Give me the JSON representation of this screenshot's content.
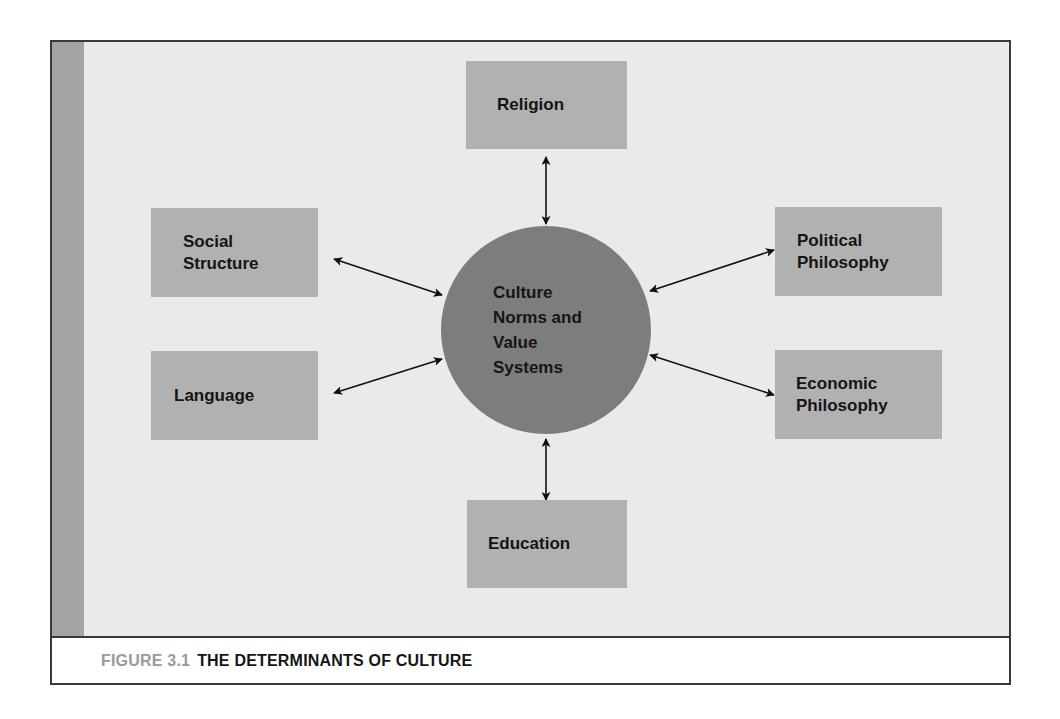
{
  "figure": {
    "number": "FIGURE 3.1",
    "title": "THE DETERMINANTS OF CULTURE"
  },
  "center": {
    "lines": [
      "Culture",
      "Norms and",
      "Value",
      "Systems"
    ]
  },
  "nodes": {
    "religion": {
      "lines": [
        "Religion"
      ]
    },
    "social_structure": {
      "lines": [
        "Social",
        "Structure"
      ]
    },
    "language": {
      "lines": [
        "Language"
      ]
    },
    "political_philosophy": {
      "lines": [
        "Political",
        "Philosophy"
      ]
    },
    "economic_philosophy": {
      "lines": [
        "Economic",
        "Philosophy"
      ]
    },
    "education": {
      "lines": [
        "Education"
      ]
    }
  },
  "edges": [
    {
      "from": "culture",
      "to": "religion",
      "type": "bidirectional"
    },
    {
      "from": "culture",
      "to": "social_structure",
      "type": "bidirectional"
    },
    {
      "from": "culture",
      "to": "language",
      "type": "bidirectional"
    },
    {
      "from": "culture",
      "to": "political_philosophy",
      "type": "bidirectional"
    },
    {
      "from": "culture",
      "to": "economic_philosophy",
      "type": "bidirectional"
    },
    {
      "from": "culture",
      "to": "education",
      "type": "bidirectional"
    }
  ],
  "colors": {
    "panel_bg": "#eaeaea",
    "left_strip": "#a4a4a4",
    "box_fill": "#b1b1b1",
    "circle_fill": "#7d7d7d",
    "text": "#151515",
    "figure_number": "#9a9a9a",
    "border": "#3a3a3a"
  }
}
